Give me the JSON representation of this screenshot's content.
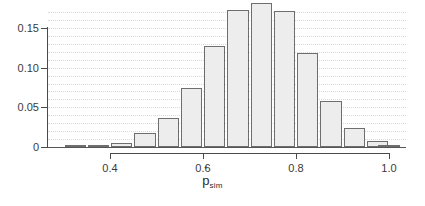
{
  "chart_data": {
    "type": "bar",
    "title": "",
    "subtitle": "",
    "xlabel": "p̂_sim",
    "xlabel_parts": {
      "base": "p",
      "hat": "ˆ",
      "subscript": "sim"
    },
    "ylabel": "",
    "xlim": [
      0.28,
      1.02
    ],
    "ylim": [
      0,
      0.19
    ],
    "grid": true,
    "grid_axis": "y",
    "legend": null,
    "bin_width": 0.05,
    "bar_color": "#ededed",
    "bar_edge_color": "#6e6e6e",
    "axis_color": "#4a4a4a",
    "grid_color": "#d9d9d9",
    "categories": [
      "0.30",
      "0.35",
      "0.40",
      "0.45",
      "0.50",
      "0.55",
      "0.60",
      "0.65",
      "0.70",
      "0.75",
      "0.80",
      "0.85",
      "0.90",
      "0.95",
      "1.00"
    ],
    "bin_centers": [
      0.325,
      0.375,
      0.425,
      0.475,
      0.525,
      0.575,
      0.625,
      0.675,
      0.725,
      0.775,
      0.825,
      0.875,
      0.925,
      0.975,
      1.0
    ],
    "values": [
      0.0005,
      0.0012,
      0.005,
      0.018,
      0.037,
      0.074,
      0.127,
      0.173,
      0.181,
      0.172,
      0.119,
      0.058,
      0.024,
      0.008,
      0.001
    ],
    "xticks": [
      0.4,
      0.6,
      0.8,
      1.0
    ],
    "xtick_labels": [
      "0.4",
      "0.6",
      "0.8",
      "1.0"
    ],
    "yticks": [
      0,
      0.05,
      0.1,
      0.15
    ],
    "ytick_labels": [
      "0",
      "0.05",
      "0.10",
      "0.15"
    ],
    "gridlines": [
      0.01,
      0.02,
      0.03,
      0.04,
      0.05,
      0.06,
      0.07,
      0.08,
      0.09,
      0.1,
      0.11,
      0.12,
      0.13,
      0.14,
      0.15,
      0.16,
      0.17
    ]
  }
}
